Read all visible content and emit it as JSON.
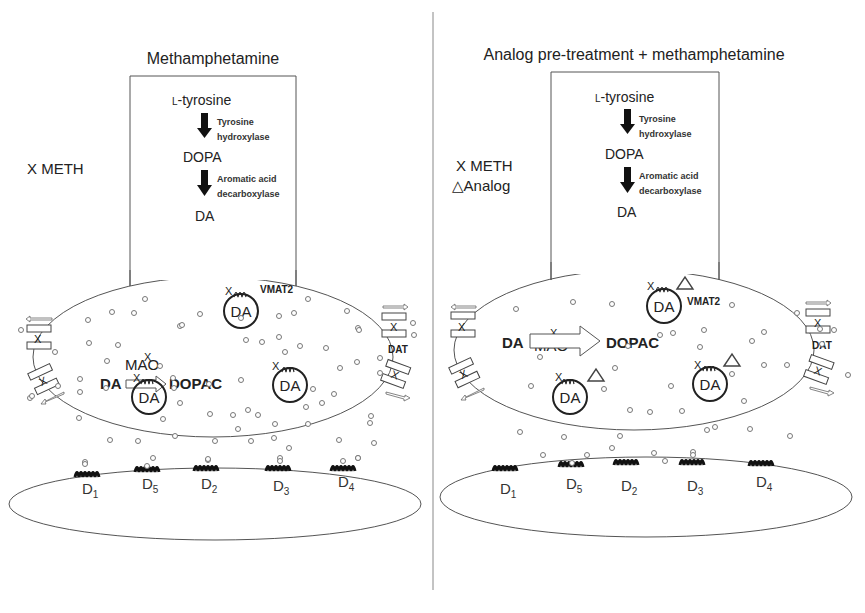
{
  "panels": [
    {
      "id": "left",
      "title": "Methamphetamine",
      "legend": [
        {
          "symbol": "X",
          "label": "METH"
        }
      ],
      "synthesis": {
        "steps": [
          "L-tyrosine",
          "DOPA",
          "DA"
        ],
        "enzymes": [
          [
            "Tyrosine",
            "hydroxylase"
          ],
          [
            "Aromatic acid",
            "decarboxylase"
          ]
        ]
      },
      "metabolism": {
        "substrate": "DA",
        "enzyme": "MAO",
        "product": "DOPAC",
        "enzyme_marker": "X"
      },
      "vesicle_label": "DA",
      "vmat_label": "VMAT2",
      "dat_label": "DAT",
      "vesicle_marker": "X",
      "analog_markers": false,
      "receptors": [
        {
          "name": "D",
          "sub": "1"
        },
        {
          "name": "D",
          "sub": "5"
        },
        {
          "name": "D",
          "sub": "2"
        },
        {
          "name": "D",
          "sub": "3"
        },
        {
          "name": "D",
          "sub": "4"
        }
      ]
    },
    {
      "id": "right",
      "title": "Analog pre-treatment + methamphetamine",
      "legend": [
        {
          "symbol": "X",
          "label": "METH"
        },
        {
          "symbol": "△",
          "label": "Analog"
        }
      ],
      "synthesis": {
        "steps": [
          "L-tyrosine",
          "DOPA",
          "DA"
        ],
        "enzymes": [
          [
            "Tyrosine",
            "hydroxylase"
          ],
          [
            "Aromatic acid",
            "decarboxylase"
          ]
        ]
      },
      "metabolism": {
        "substrate": "DA",
        "enzyme": "MAO",
        "product": "DOPAC",
        "enzyme_marker": "X"
      },
      "vesicle_label": "DA",
      "vmat_label": "VMAT2",
      "dat_label": "DAT",
      "vesicle_marker": "X",
      "analog_markers": true,
      "receptors": [
        {
          "name": "D",
          "sub": "1"
        },
        {
          "name": "D",
          "sub": "5"
        },
        {
          "name": "D",
          "sub": "2"
        },
        {
          "name": "D",
          "sub": "3"
        },
        {
          "name": "D",
          "sub": "4"
        }
      ]
    }
  ]
}
